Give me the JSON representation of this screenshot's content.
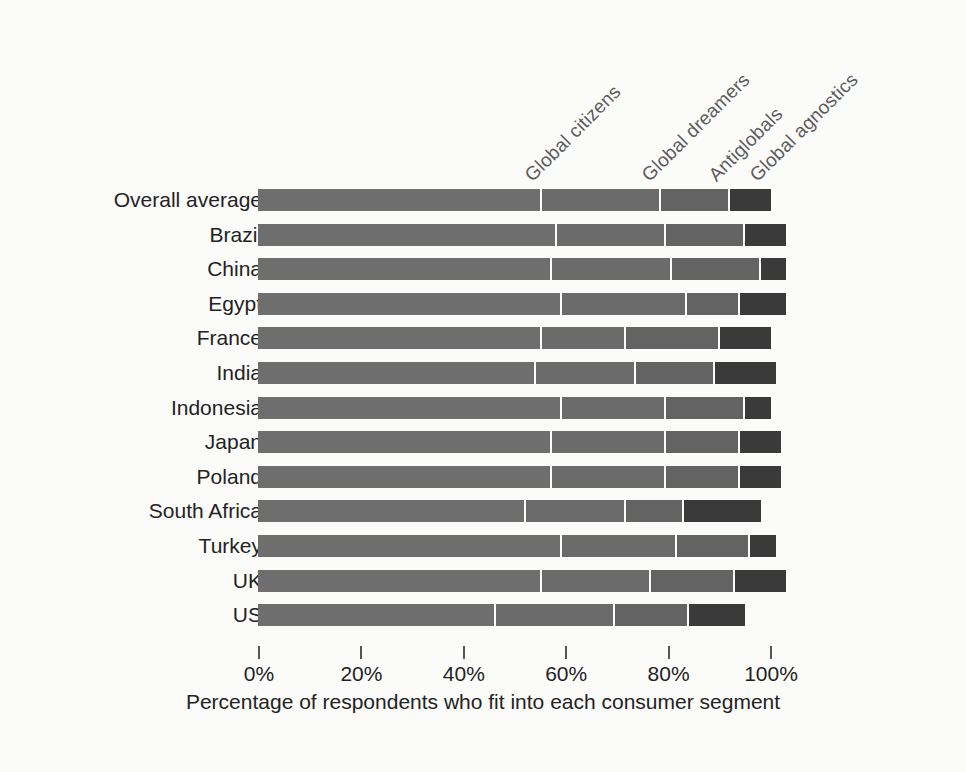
{
  "chart_data": {
    "type": "bar",
    "orientation": "horizontal",
    "stacked": true,
    "title": "",
    "xlabel": "Percentage of respondents who fit into each consumer segment",
    "ylabel": "",
    "xlim": [
      0,
      100
    ],
    "xticks": [
      "0%",
      "20%",
      "40%",
      "60%",
      "80%",
      "100%"
    ],
    "xtick_values": [
      0,
      20,
      40,
      60,
      80,
      100
    ],
    "grid": false,
    "legend_position": "top-rotated",
    "categories": [
      "Overall average",
      "Brazil",
      "China",
      "Egypt",
      "France",
      "India",
      "Indonesia",
      "Japan",
      "Poland",
      "South Africa",
      "Turkey",
      "UK",
      "US"
    ],
    "series": [
      {
        "name": "Global citizens",
        "color": "#6e6e6e",
        "values": [
          55,
          58,
          57,
          59,
          55,
          54,
          59,
          57,
          57,
          52,
          59,
          55,
          46
        ]
      },
      {
        "name": "Global dreamers",
        "color": "#6b6b6b",
        "values": [
          23,
          21,
          23,
          24,
          16,
          19,
          20,
          22,
          22,
          19,
          22,
          21,
          23
        ]
      },
      {
        "name": "Antiglobals",
        "color": "#636363",
        "values": [
          13,
          15,
          17,
          10,
          18,
          15,
          15,
          14,
          14,
          11,
          14,
          16,
          14
        ]
      },
      {
        "name": "Global agnostics",
        "color": "#3a3a3a",
        "values": [
          8,
          8,
          5,
          9,
          10,
          12,
          5,
          8,
          8,
          15,
          5,
          10,
          11
        ]
      }
    ]
  },
  "axis": {
    "title": "Percentage of respondents who fit into each consumer segment"
  },
  "colors": {
    "background": "#fbfbf9",
    "segment_1": "#6e6e6e",
    "segment_2": "#6b6b6b",
    "segment_3": "#636363",
    "segment_4": "#3a3a3a",
    "text": "#232323",
    "label_text": "#5c5c5c"
  }
}
